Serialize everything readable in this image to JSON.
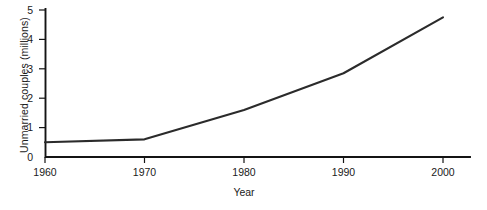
{
  "chart_data": {
    "type": "line",
    "title": "",
    "xlabel": "Year",
    "ylabel": "Unmarried couples (millions)",
    "x": [
      1960,
      1970,
      1980,
      1990,
      2000
    ],
    "xtick_labels": [
      "1960",
      "1970",
      "1980",
      "1990",
      "2000"
    ],
    "ytick_labels": [
      "0",
      "1",
      "2",
      "3",
      "4",
      "5"
    ],
    "yticks": [
      0,
      1,
      2,
      3,
      4,
      5
    ],
    "xlim": [
      1960,
      2000
    ],
    "ylim": [
      0,
      5
    ],
    "grid": false,
    "legend": false,
    "series": [
      {
        "name": "Unmarried couples",
        "values": [
          0.5,
          0.6,
          1.6,
          2.85,
          4.75
        ],
        "color": "#2b2b2b"
      }
    ]
  },
  "axes": {
    "y_title": "Unmarried couples (millions)",
    "x_title": "Year",
    "y_labels": [
      "5",
      "4",
      "3",
      "2",
      "1",
      "0"
    ],
    "x_labels": [
      "1960",
      "1970",
      "1980",
      "1990",
      "2000"
    ]
  },
  "colors": {
    "line": "#2b2b2b",
    "axis": "#141414",
    "background": "#ffffff",
    "text": "#1a1a1a"
  }
}
